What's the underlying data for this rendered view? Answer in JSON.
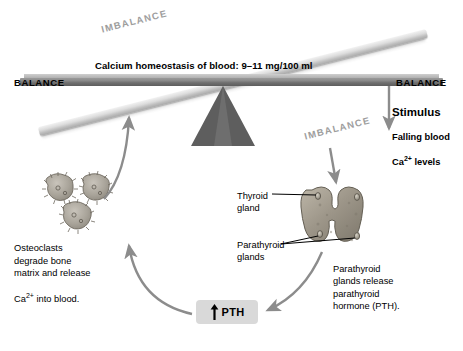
{
  "diagram": {
    "scale": {
      "homeostasis_banner": "Calcium homeostasis of blood: 9–11 mg/100 ml",
      "balance_left": "BALANCE",
      "balance_right": "BALANCE",
      "imbalance_top": "IMBALANCE",
      "imbalance_bottom": "IMBALANCE"
    },
    "stimulus": {
      "title": "Stimulus",
      "line1": "Falling blood",
      "line2_prefix": "Ca",
      "line2_sup": "2+",
      "line2_suffix": " levels"
    },
    "osteoclasts": {
      "caption": "Osteoclasts\ndegrade bone\nmatrix and release",
      "caption_last_prefix": "Ca",
      "caption_last_sup": "2+",
      "caption_last_suffix": " into blood."
    },
    "gland": {
      "thyroid_label": "Thyroid\ngland",
      "parathyroid_label": "Parathyroid\nglands",
      "caption": "Parathyroid\nglands release\nparathyroid\nhormone (PTH)."
    },
    "pth": {
      "label": "PTH",
      "arrow": "up-arrow"
    },
    "colors": {
      "beam_dark": "#6f6f6f",
      "beam_light": "#dcdcdc",
      "fulcrum": "#5e5e5e",
      "arrow_gray": "#8c8c8c",
      "pth_box": "#d9d9d9",
      "text": "#000000",
      "imbalance_text": "#9d9d9d",
      "background": "#ffffff"
    }
  }
}
